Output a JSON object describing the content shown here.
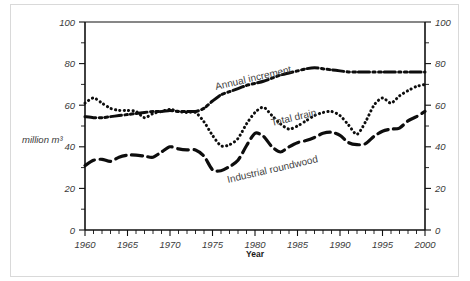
{
  "figure": {
    "border_color": "#d9d9d9",
    "background": "#ffffff"
  },
  "axes": {
    "x_title": "Year",
    "y_title": "million m³",
    "x_ticks": [
      "1960",
      "1965",
      "1970",
      "1975",
      "1980",
      "1985",
      "1990",
      "1995",
      "2000"
    ],
    "y_ticks_left": [
      "0",
      "20",
      "40",
      "60",
      "80",
      "100"
    ],
    "y_ticks_right": [
      "0",
      "20",
      "40",
      "60",
      "80",
      "100"
    ]
  },
  "series_labels": {
    "annual_increment": "Annual increment",
    "total_drain": "Total drain",
    "industrial_roundwood": "Industrial roundwood"
  },
  "chart_data": {
    "type": "line",
    "title": "",
    "xlabel": "Year",
    "ylabel": "million m³",
    "xlim": [
      1960,
      2000
    ],
    "ylim": [
      0,
      100
    ],
    "grid": false,
    "legend_position": "inline-annotations",
    "x": [
      1960,
      1961,
      1962,
      1963,
      1964,
      1965,
      1966,
      1967,
      1968,
      1969,
      1970,
      1971,
      1972,
      1973,
      1974,
      1975,
      1976,
      1977,
      1978,
      1979,
      1980,
      1981,
      1982,
      1983,
      1984,
      1985,
      1986,
      1987,
      1988,
      1989,
      1990,
      1991,
      1992,
      1993,
      1994,
      1995,
      1996,
      1997,
      1998,
      1999,
      2000
    ],
    "series": [
      {
        "name": "Annual increment",
        "style": "dash-dot-dot",
        "values": [
          54.5,
          54.0,
          54.0,
          54.5,
          55.0,
          55.5,
          56.0,
          56.5,
          57.0,
          57.0,
          57.5,
          57.0,
          57.0,
          57.0,
          58.5,
          62.0,
          65.0,
          66.5,
          68.0,
          69.5,
          70.5,
          71.5,
          73.0,
          74.5,
          75.5,
          76.5,
          77.5,
          78.0,
          77.5,
          77.0,
          76.5,
          76.0,
          76.0,
          76.0,
          76.0,
          76.0,
          76.0,
          76.0,
          76.0,
          76.0,
          76.0
        ]
      },
      {
        "name": "Total drain",
        "style": "dotted",
        "values": [
          61.0,
          63.5,
          61.0,
          58.5,
          57.5,
          57.5,
          57.0,
          54.0,
          56.0,
          57.0,
          58.0,
          57.0,
          56.5,
          56.5,
          52.0,
          45.5,
          40.5,
          41.0,
          44.0,
          51.0,
          56.5,
          59.0,
          55.0,
          51.0,
          48.5,
          50.0,
          52.5,
          55.0,
          56.5,
          57.0,
          55.0,
          50.5,
          46.0,
          52.0,
          60.0,
          63.5,
          61.0,
          64.5,
          67.0,
          69.0,
          70.0
        ]
      },
      {
        "name": "Industrial roundwood",
        "style": "dashed",
        "values": [
          31.0,
          33.5,
          34.0,
          33.0,
          35.0,
          36.0,
          36.0,
          35.5,
          35.0,
          37.5,
          40.0,
          39.0,
          38.5,
          38.5,
          35.5,
          29.0,
          28.5,
          30.5,
          33.5,
          40.5,
          46.5,
          45.0,
          40.0,
          37.5,
          40.0,
          42.0,
          43.0,
          44.5,
          46.5,
          47.0,
          45.5,
          42.0,
          41.0,
          41.5,
          45.0,
          47.5,
          48.5,
          49.0,
          52.5,
          54.5,
          57.0
        ]
      }
    ]
  }
}
